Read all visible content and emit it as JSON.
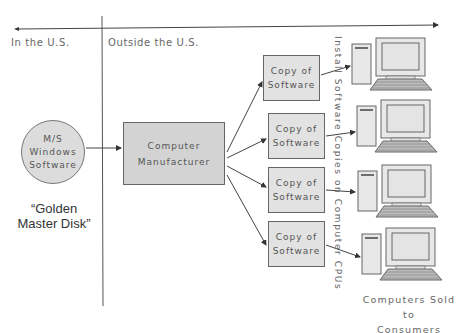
{
  "regions": {
    "left": "In the U.S.",
    "right": "Outside the U.S."
  },
  "source": {
    "line1": "M/S",
    "line2": "Windows",
    "line3": "Software",
    "caption_line1": "“Golden",
    "caption_line2": "Master Disk”"
  },
  "manufacturer": {
    "line1": "Computer",
    "line2": "Manufacturer"
  },
  "copies": [
    {
      "line1": "Copy of",
      "line2": "Software"
    },
    {
      "line1": "Copy of",
      "line2": "Software"
    },
    {
      "line1": "Copy of",
      "line2": "Software"
    },
    {
      "line1": "Copy of",
      "line2": "Software"
    }
  ],
  "install_label": "Install Software Copies on Computer CPUs",
  "consumers": {
    "line1": "Computers Sold to",
    "line2": "Consumers"
  },
  "colors": {
    "box_fill": "#d3d3d3",
    "copy_fill": "#e2e2e2",
    "stroke": "#555555",
    "computer_fill": "#e8e8e8"
  }
}
